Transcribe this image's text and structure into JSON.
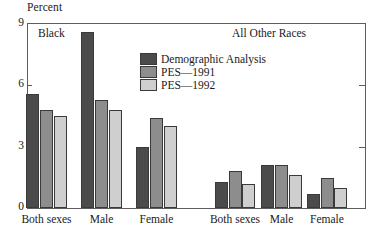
{
  "chart_data": {
    "type": "bar",
    "title": "",
    "xlabel": "",
    "ylabel": "Percent",
    "ylim": [
      0,
      9
    ],
    "yticks": [
      0,
      3,
      6,
      9
    ],
    "grid": false,
    "legend_position": "inside-top-center",
    "panels": [
      {
        "caption": "Black",
        "categories": [
          "Both sexes",
          "Male",
          "Female"
        ]
      },
      {
        "caption": "All Other Races",
        "categories": [
          "Both sexes",
          "Male",
          "Female"
        ]
      }
    ],
    "categories": [
      "Black / Both sexes",
      "Black / Male",
      "Black / Female",
      "All Other Races / Both sexes",
      "All Other Races / Male",
      "All Other Races / Female"
    ],
    "series": [
      {
        "name": "Demographic Analysis",
        "color": "#4b4b4b",
        "values": [
          5.6,
          8.6,
          3.0,
          1.3,
          2.1,
          0.7
        ]
      },
      {
        "name": "PES—1991",
        "color": "#8d8d8d",
        "values": [
          4.8,
          5.3,
          4.4,
          1.8,
          2.1,
          1.5
        ]
      },
      {
        "name": "PES—1992",
        "color": "#cfcfcf",
        "values": [
          4.5,
          4.8,
          4.0,
          1.2,
          1.6,
          1.0
        ]
      }
    ]
  },
  "axis": {
    "y_title": "Percent",
    "y_tick_labels": [
      "9",
      "6",
      "3",
      "0"
    ]
  },
  "legend": {
    "items": [
      {
        "label": "Demographic Analysis",
        "color": "#4b4b4b"
      },
      {
        "label": "PES—1991",
        "color": "#8d8d8d"
      },
      {
        "label": "PES—1992",
        "color": "#cfcfcf"
      }
    ]
  },
  "panel_captions": {
    "left": "Black",
    "right": "All Other Races"
  },
  "x_labels": [
    "Both sexes",
    "Male",
    "Female",
    "Both sexes",
    "Male",
    "Female"
  ]
}
